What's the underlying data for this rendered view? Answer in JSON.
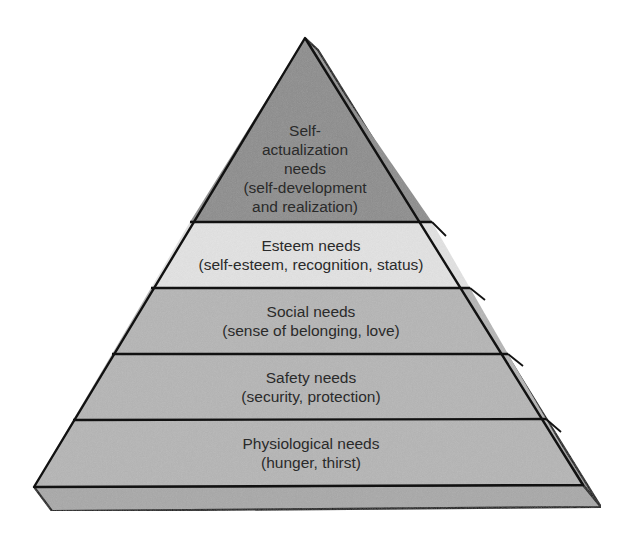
{
  "diagram": {
    "type": "pyramid",
    "levels": [
      {
        "order": 5,
        "position": "top",
        "lines": [
          "Self-",
          "actualization",
          "needs",
          "(self-development",
          "and realization)"
        ],
        "title": "Self-actualization needs",
        "detail": "(self-development and realization)",
        "fill": "#8c8c8c"
      },
      {
        "order": 4,
        "position": "second",
        "lines": [
          "Esteem needs",
          "(self-esteem, recognition, status)"
        ],
        "title": "Esteem needs",
        "detail": "(self-esteem, recognition, status)",
        "fill": "#e3e3e3"
      },
      {
        "order": 3,
        "position": "middle",
        "lines": [
          "Social needs",
          "(sense of belonging, love)"
        ],
        "title": "Social needs",
        "detail": "(sense of belonging, love)",
        "fill": "#b5b5b5"
      },
      {
        "order": 2,
        "position": "fourth",
        "lines": [
          "Safety needs",
          "(security, protection)"
        ],
        "title": "Safety needs",
        "detail": "(security, protection)",
        "fill": "#b5b5b5"
      },
      {
        "order": 1,
        "position": "base",
        "lines": [
          "Physiological needs",
          "(hunger, thirst)"
        ],
        "title": "Physiological needs",
        "detail": "(hunger, thirst)",
        "fill": "#b5b5b5"
      }
    ],
    "colors": {
      "outline": "#111111",
      "side_face": "#9a9a9a",
      "base_slab": "#a8a8a8",
      "text": "#2a2a2a",
      "background": "#ffffff"
    }
  }
}
